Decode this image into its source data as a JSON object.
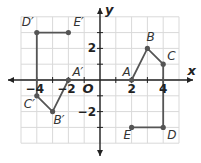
{
  "chart_data": {
    "type": "scatter",
    "title": "",
    "xlabel": "x",
    "ylabel": "y",
    "xlim": [
      -5,
      5
    ],
    "ylim": [
      -4,
      4
    ],
    "grid": true,
    "origin_label": "O",
    "x_ticks": [
      {
        "value": -4,
        "label": "−4"
      },
      {
        "value": -2,
        "label": "−2"
      },
      {
        "value": 2,
        "label": "2"
      },
      {
        "value": 4,
        "label": "4"
      }
    ],
    "y_ticks": [
      {
        "value": 2,
        "label": "2"
      },
      {
        "value": -2,
        "label": "−2"
      }
    ],
    "series": [
      {
        "name": "original",
        "points": [
          {
            "label": "A",
            "x": 2,
            "y": 0
          },
          {
            "label": "B",
            "x": 3,
            "y": 2
          },
          {
            "label": "C",
            "x": 4,
            "y": 1
          },
          {
            "label": "D",
            "x": 4,
            "y": -3
          },
          {
            "label": "E",
            "x": 2,
            "y": -3
          }
        ]
      },
      {
        "name": "image",
        "points": [
          {
            "label": "A′",
            "x": -2,
            "y": 0
          },
          {
            "label": "B′",
            "x": -3,
            "y": -2
          },
          {
            "label": "C′",
            "x": -4,
            "y": -1
          },
          {
            "label": "D′",
            "x": -4,
            "y": 3
          },
          {
            "label": "E′",
            "x": -2,
            "y": 3
          }
        ]
      }
    ]
  },
  "colors": {
    "grid": "#d9d9d9",
    "axis": "#222222",
    "figure": "#555555",
    "point": "#555555",
    "label": "#333333"
  }
}
